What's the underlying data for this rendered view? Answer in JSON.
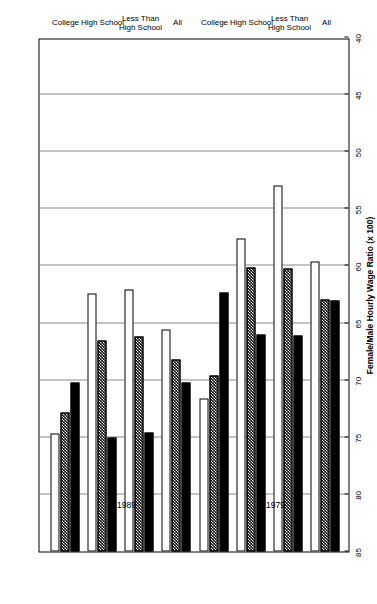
{
  "chart_data": {
    "type": "bar",
    "orientation": "horizontal",
    "title": "",
    "xlabel": "Female/Male Hourly Wage Ratio (x 100)",
    "ylabel": "",
    "xlim": [
      40,
      85
    ],
    "xticks": [
      85,
      80,
      75,
      70,
      65,
      60,
      55,
      50,
      45,
      40
    ],
    "grid": true,
    "legend_position": "top",
    "periods": [
      "1979",
      "1989"
    ],
    "categories": [
      "All",
      "Less Than\nHigh School",
      "High School",
      "College"
    ],
    "group_labels": [
      {
        "period": "1979",
        "categories": [
          "All",
          "Less Than High School",
          "High School",
          "College"
        ]
      },
      {
        "period": "1989",
        "categories": [
          "All",
          "Less Than High School",
          "High School",
          "College"
        ]
      }
    ],
    "series": [
      {
        "name": "Dallas",
        "style": "solid-black",
        "color": "#000000",
        "values_1979": [
          63.0,
          66.1,
          66.0,
          62.3
        ],
        "values_1989": [
          70.2,
          74.6,
          75.0,
          70.2
        ]
      },
      {
        "name": "U.S.",
        "style": "hatched",
        "color": "#000000",
        "values_1979": [
          62.9,
          60.2,
          60.1,
          69.6
        ],
        "values_1989": [
          68.2,
          66.2,
          66.5,
          72.8
        ]
      },
      {
        "name": "Detroit",
        "style": "open-white",
        "color": "#ffffff",
        "values_1979": [
          59.6,
          53.0,
          57.6,
          71.6
        ],
        "values_1989": [
          65.6,
          62.1,
          62.4,
          74.7
        ]
      }
    ]
  },
  "legend": {
    "items": [
      {
        "label": "Dallas",
        "swatch": "solid-black"
      },
      {
        "label": "U.S.",
        "swatch": "hatched"
      },
      {
        "label": "Detroit",
        "swatch": "open-white"
      }
    ]
  },
  "axis": {
    "value_axis_title": "Female/Male Hourly Wage Ratio (x 100)",
    "ticks": [
      "85",
      "80",
      "75",
      "70",
      "65",
      "60",
      "55",
      "50",
      "45",
      "40"
    ]
  },
  "period_labels": [
    "1979",
    "1989"
  ],
  "category_labels_1979": [
    "All",
    "Less Than",
    "High School",
    "High School",
    "College"
  ],
  "categories_display": [
    {
      "line1": "All",
      "line2": ""
    },
    {
      "line1": "Less Than",
      "line2": "High School"
    },
    {
      "line1": "High School",
      "line2": ""
    },
    {
      "line1": "College",
      "line2": ""
    }
  ]
}
